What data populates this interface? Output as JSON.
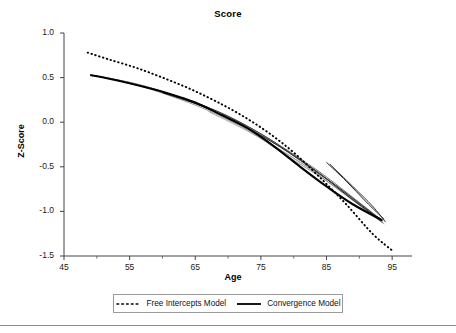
{
  "chart_data": {
    "type": "line",
    "title": "Score",
    "xlabel": "Age",
    "ylabel": "Z-Score",
    "xlim": [
      45,
      96.5
    ],
    "ylim": [
      -1.5,
      1.0
    ],
    "xticks": [
      45,
      55,
      65,
      75,
      85,
      95
    ],
    "xtick_labels": [
      "45",
      "55",
      "65",
      "75",
      "85",
      "95"
    ],
    "x_minor_ticks": [
      50,
      60,
      70,
      80,
      90
    ],
    "yticks": [
      -1.5,
      -1.0,
      -0.5,
      0.0,
      0.5,
      1.0
    ],
    "ytick_labels": [
      "-1.5",
      "-1.0",
      "-0.5",
      "0.0",
      "0.5",
      "1.0"
    ],
    "grid": false,
    "legend_position": "below-axes",
    "series": [
      {
        "name": "Free Intercepts Model",
        "style": "dotted",
        "color": "#000000",
        "x": [
          48.6,
          52,
          56,
          60,
          64,
          68,
          72,
          76,
          80,
          84,
          88,
          92,
          95.2
        ],
        "y": [
          0.78,
          0.7,
          0.61,
          0.5,
          0.38,
          0.24,
          0.08,
          -0.11,
          -0.34,
          -0.62,
          -0.92,
          -1.25,
          -1.45
        ]
      },
      {
        "name": "Convergence Model",
        "style": "solid",
        "color": "#000000",
        "x": [
          49,
          53,
          57,
          61,
          65,
          69,
          73,
          77,
          81,
          85,
          89,
          93.5
        ],
        "y": [
          0.53,
          0.47,
          0.4,
          0.32,
          0.22,
          0.08,
          -0.07,
          -0.27,
          -0.5,
          -0.72,
          -0.92,
          -1.1
        ]
      },
      {
        "name": "Individual trajectory 1",
        "style": "solid-gray",
        "color": "#9a9a9a",
        "x": [
          49,
          55,
          61,
          67,
          73,
          79,
          85,
          91,
          93.8
        ],
        "y": [
          0.53,
          0.44,
          0.3,
          0.13,
          -0.09,
          -0.38,
          -0.66,
          -0.98,
          -1.14
        ]
      },
      {
        "name": "Individual trajectory 2",
        "style": "solid-gray",
        "color": "#7d7d7d",
        "x": [
          49,
          56,
          63,
          70,
          77,
          84,
          90,
          93.5
        ],
        "y": [
          0.53,
          0.43,
          0.27,
          0.07,
          -0.22,
          -0.56,
          -0.9,
          -1.1
        ]
      },
      {
        "name": "Individual trajectory 3",
        "style": "solid-gray",
        "color": "#b4b4b4",
        "x": [
          49,
          57,
          65,
          73,
          81,
          88,
          93
        ],
        "y": [
          0.53,
          0.41,
          0.21,
          -0.05,
          -0.42,
          -0.8,
          -1.08
        ]
      },
      {
        "name": "Individual trajectory 4",
        "style": "solid-dark",
        "color": "#2b2b2b",
        "x": [
          60,
          66,
          72,
          78,
          84,
          89,
          93.6
        ],
        "y": [
          0.33,
          0.18,
          -0.03,
          -0.28,
          -0.58,
          -0.87,
          -1.11
        ]
      },
      {
        "name": "Individual trajectory 5",
        "style": "solid-dark",
        "color": "#3d3d3d",
        "x": [
          63,
          69,
          75,
          81,
          87,
          93.2
        ],
        "y": [
          0.28,
          0.1,
          -0.13,
          -0.42,
          -0.74,
          -1.09
        ]
      },
      {
        "name": "Individual trajectory 6",
        "style": "solid-dark",
        "color": "#1f1f1f",
        "x": [
          85,
          88,
          91,
          93.8
        ],
        "y": [
          -0.45,
          -0.66,
          -0.89,
          -1.09
        ]
      },
      {
        "name": "Individual trajectory 7",
        "style": "solid-dark",
        "color": "#333333",
        "x": [
          85.5,
          89,
          92,
          94
        ],
        "y": [
          -0.47,
          -0.72,
          -0.94,
          -1.12
        ]
      },
      {
        "name": "Individual trajectory 8",
        "style": "solid-gray",
        "color": "#8a8a8a",
        "x": [
          76,
          82,
          88,
          93
        ],
        "y": [
          -0.22,
          -0.5,
          -0.82,
          -1.1
        ]
      },
      {
        "name": "Individual trajectory 9",
        "style": "solid-gray",
        "color": "#a5a5a5",
        "x": [
          67,
          73,
          79,
          85,
          90,
          93.5
        ],
        "y": [
          0.12,
          -0.1,
          -0.36,
          -0.64,
          -0.92,
          -1.13
        ]
      },
      {
        "name": "Individual trajectory 10",
        "style": "solid-gray",
        "color": "#6e6e6e",
        "x": [
          53,
          60,
          67,
          74,
          81,
          88,
          93.4
        ],
        "y": [
          0.47,
          0.34,
          0.15,
          -0.1,
          -0.43,
          -0.8,
          -1.12
        ]
      }
    ]
  },
  "axes": {
    "title": "Score",
    "xlabel": "Age",
    "ylabel": "Z-Score"
  },
  "legend": {
    "items": [
      {
        "label": "Free Intercepts Model",
        "style": "dotted"
      },
      {
        "label": "Convergence Model",
        "style": "solid"
      }
    ]
  }
}
